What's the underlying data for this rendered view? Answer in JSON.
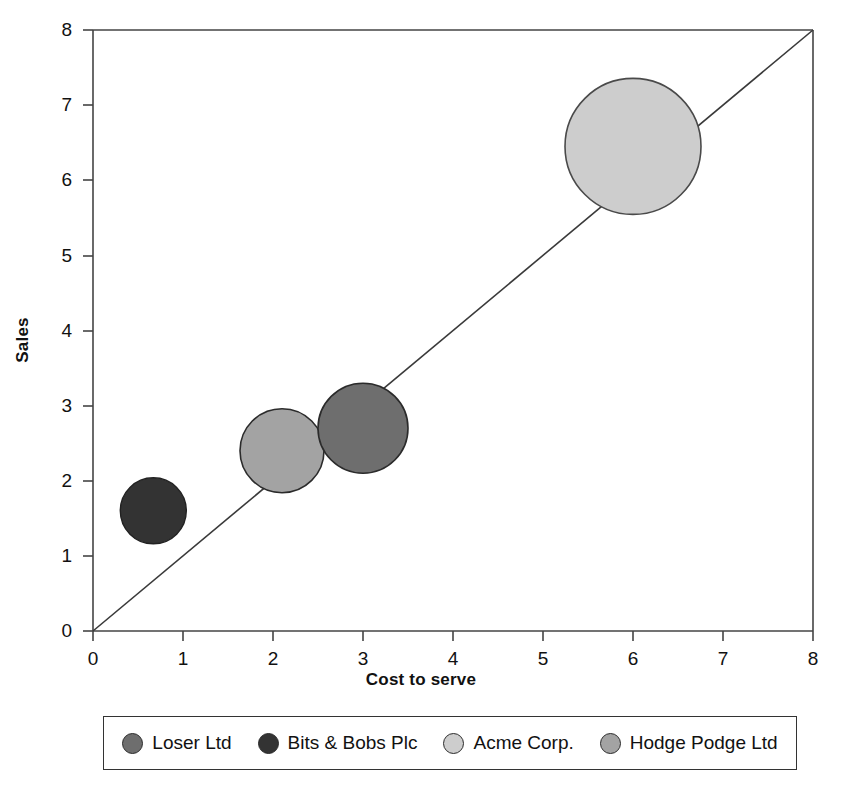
{
  "chart_data": {
    "type": "scatter",
    "title": "",
    "xlabel": "Cost to serve",
    "ylabel": "Sales",
    "xlim": [
      0,
      8
    ],
    "ylim": [
      0,
      8
    ],
    "xticks": [
      0,
      1,
      2,
      3,
      4,
      5,
      6,
      7,
      8
    ],
    "yticks": [
      0,
      1,
      2,
      3,
      4,
      5,
      6,
      7,
      8
    ],
    "grid": false,
    "legend_position": "bottom",
    "reference_line": {
      "name": "diagonal-parity-line",
      "from": [
        0,
        0
      ],
      "to": [
        8,
        8
      ]
    },
    "series": [
      {
        "name": "Loser Ltd",
        "x": 3.0,
        "y": 2.7,
        "size": 45,
        "color": "#6e6e6e"
      },
      {
        "name": "Bits & Bobs Plc",
        "x": 0.67,
        "y": 1.6,
        "size": 33,
        "color": "#333333"
      },
      {
        "name": "Acme Corp.",
        "x": 6.0,
        "y": 6.45,
        "size": 68,
        "color": "#cdcdcd"
      },
      {
        "name": "Hodge Podge Ltd",
        "x": 2.1,
        "y": 2.4,
        "size": 42,
        "color": "#a3a3a3"
      }
    ]
  },
  "axes": {
    "x_title": "Cost to serve",
    "y_title": "Sales",
    "x_tick_labels": [
      "0",
      "1",
      "2",
      "3",
      "4",
      "5",
      "6",
      "7",
      "8"
    ],
    "y_tick_labels": [
      "0",
      "1",
      "2",
      "3",
      "4",
      "5",
      "6",
      "7",
      "8"
    ]
  },
  "legend": {
    "items": [
      {
        "label": "Loser Ltd",
        "color": "#6e6e6e"
      },
      {
        "label": "Bits & Bobs Plc",
        "color": "#333333"
      },
      {
        "label": "Acme Corp.",
        "color": "#cdcdcd"
      },
      {
        "label": "Hodge Podge Ltd",
        "color": "#a3a3a3"
      }
    ]
  },
  "style": {
    "axis_color": "#444444",
    "bubble_stroke": "#2b2b2b",
    "background": "#ffffff"
  }
}
